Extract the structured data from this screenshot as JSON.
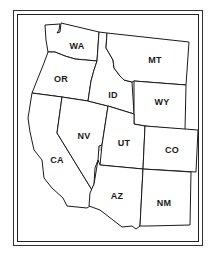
{
  "map": {
    "title": "",
    "highlighted_state": "NV",
    "highlight_color": "#d4d4d4",
    "states": [
      {
        "id": "WA",
        "label": "WA"
      },
      {
        "id": "OR",
        "label": "OR"
      },
      {
        "id": "CA",
        "label": "CA"
      },
      {
        "id": "NV",
        "label": "NV"
      },
      {
        "id": "ID",
        "label": "ID"
      },
      {
        "id": "MT",
        "label": "MT"
      },
      {
        "id": "WY",
        "label": "WY"
      },
      {
        "id": "UT",
        "label": "UT"
      },
      {
        "id": "CO",
        "label": "CO"
      },
      {
        "id": "AZ",
        "label": "AZ"
      },
      {
        "id": "NM",
        "label": "NM"
      }
    ]
  }
}
